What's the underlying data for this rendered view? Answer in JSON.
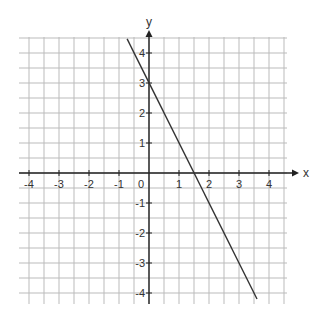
{
  "chart_data": {
    "type": "line",
    "title": "",
    "xlabel": "x",
    "ylabel": "y",
    "xlim": [
      -4.33,
      4.6
    ],
    "ylim": [
      -4.37,
      4.47
    ],
    "grid": true,
    "grid_step": 0.5,
    "x_ticks": [
      -4,
      -3,
      -2,
      -1,
      0,
      1,
      2,
      3,
      4
    ],
    "y_ticks": [
      -4,
      -3,
      -2,
      -1,
      1,
      2,
      3,
      4
    ],
    "x_tick_labels": [
      "-4",
      "-3",
      "-2",
      "-1",
      "0",
      "1",
      "2",
      "3",
      "4"
    ],
    "y_tick_labels": [
      "-4",
      "-3",
      "-2",
      "-1",
      "1",
      "2",
      "3",
      "4"
    ],
    "series": [
      {
        "name": "y = -2x + 3",
        "slope": -2,
        "intercept": 3,
        "x": [
          -0.73,
          3.6
        ],
        "y": [
          4.47,
          -4.2
        ],
        "color": "#333333"
      }
    ],
    "legend": null
  },
  "layout": {
    "origin_px": [
      149,
      173
    ],
    "unit_px": 30,
    "grid_bounds_px": {
      "left": 19,
      "right": 287,
      "top": 39,
      "bottom": 304
    },
    "grid_color": "#bbbbbb",
    "axis_color": "#222222"
  }
}
